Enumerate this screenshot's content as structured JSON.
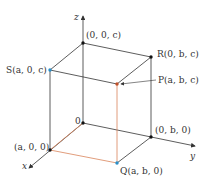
{
  "diagram": {
    "type": "3d-rectangular-box",
    "colors": {
      "edge": "#333333",
      "hidden_edge": "#d9845a",
      "point_dark": "#111111",
      "point_blue": "#2a8fc8",
      "point_orange": "#c0502a",
      "background": "#ffffff"
    },
    "axes": {
      "x": "x",
      "y": "y",
      "z": "z"
    },
    "points": {
      "origin": "0",
      "top_axis": "(0, 0, c)",
      "S": "S(a, 0, c)",
      "R": "R(0, b, c)",
      "P": "P(a, b, c)",
      "x_point": "(a, 0, 0)",
      "y_point": "(0, b, 0)",
      "Q": "Q(a, b, 0)"
    }
  }
}
